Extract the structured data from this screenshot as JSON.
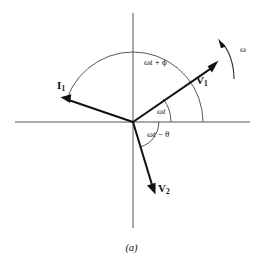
{
  "figure": {
    "caption": "(a)",
    "background_color": "#ffffff",
    "ink_color": "#111111",
    "axis_color": "#555555"
  },
  "axes": {
    "horizontal_label": "",
    "vertical_label": "",
    "origin": {
      "x": 133,
      "y": 122
    },
    "x_axis": {
      "x1": 15,
      "y1": 122,
      "x2": 250,
      "y2": 122
    },
    "y_axis": {
      "x1": 133,
      "y1": 13,
      "x2": 133,
      "y2": 228
    }
  },
  "vectors": [
    {
      "name": "V1",
      "label": "V",
      "subscript": "1",
      "tip": {
        "x": 217,
        "y": 62
      },
      "angle_deg": 37,
      "color": "#111111"
    },
    {
      "name": "V2",
      "label": "V",
      "subscript": "2",
      "tip": {
        "x": 155,
        "y": 193
      },
      "angle_deg": -72,
      "color": "#111111"
    },
    {
      "name": "I1",
      "label": "I",
      "subscript": "1",
      "tip": {
        "x": 62,
        "y": 98
      },
      "angle_deg": 160,
      "color": "#111111"
    }
  ],
  "angle_arcs": [
    {
      "name": "wt-plus-phi",
      "label_prefix": "ω",
      "label_italic": "t",
      "label_suffix": " + ϕ",
      "full_label": "ωt + ϕ",
      "from_deg": 0,
      "to_deg": 160,
      "radius": 70
    },
    {
      "name": "wt",
      "label_prefix": "ω",
      "label_italic": "t",
      "label_suffix": "",
      "full_label": "ωt",
      "from_deg": 0,
      "to_deg": 37,
      "radius": 38
    },
    {
      "name": "wt-minus-theta",
      "label_prefix": "ω",
      "label_italic": "t",
      "label_suffix": " − θ",
      "full_label": "ωt − θ",
      "from_deg": 0,
      "to_deg": -72,
      "radius": 26
    }
  ],
  "rotation_indicator": {
    "name": "omega",
    "label": "ω",
    "direction": "counterclockwise",
    "arc": {
      "start_x": 234,
      "start_y": 78,
      "end_x": 220,
      "end_y": 42
    }
  }
}
